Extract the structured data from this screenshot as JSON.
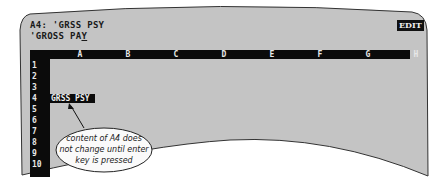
{
  "control_panel": {
    "cell_contents_line": "A4: 'GRSS PSY",
    "edit_line_prefix": "'GROSS PA",
    "edit_line_cursor": "Y",
    "mode_indicator": "EDIT"
  },
  "worksheet": {
    "columns": [
      "A",
      "B",
      "C",
      "D",
      "E",
      "F",
      "G",
      "H"
    ],
    "rows": [
      "1",
      "2",
      "3",
      "4",
      "5",
      "6",
      "7",
      "8",
      "9",
      "10"
    ],
    "cells": {
      "A4": "GRSS PSY"
    }
  },
  "annotation": {
    "text_lines": [
      "content of A4 does",
      "not change until enter",
      "key is pressed"
    ]
  },
  "colors": {
    "screen": "#c4c4c4",
    "headers": "#0b0b0b",
    "header_text": "#e8e8e8"
  }
}
